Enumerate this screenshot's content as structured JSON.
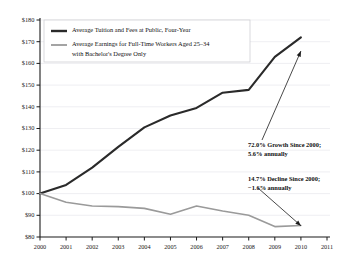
{
  "chart_data": {
    "type": "line",
    "title": "",
    "xlabel": "",
    "ylabel": "",
    "x": [
      2000,
      2001,
      2002,
      2003,
      2004,
      2005,
      2006,
      2007,
      2008,
      2009,
      2010
    ],
    "xlim": [
      2000,
      2011
    ],
    "ylim": [
      80,
      180
    ],
    "y_ticks": [
      "$80",
      "$90",
      "$100",
      "$110",
      "$120",
      "$130",
      "$140",
      "$150",
      "$160",
      "$170",
      "$180"
    ],
    "y_tick_values": [
      80,
      90,
      100,
      110,
      120,
      130,
      140,
      150,
      160,
      170,
      180
    ],
    "x_ticks": [
      "2000",
      "2001",
      "2002",
      "2003",
      "2004",
      "2005",
      "2006",
      "2007",
      "2008",
      "2009",
      "2010",
      "2011"
    ],
    "x_tick_values": [
      2000,
      2001,
      2002,
      2003,
      2004,
      2005,
      2006,
      2007,
      2008,
      2009,
      2010,
      2011
    ],
    "grid": true,
    "legend_position": "top-left",
    "series": [
      {
        "name": "Average Tuition and Fees at Public, Four-Year",
        "color": "#2a2a2a",
        "width": 2.1,
        "values": [
          100.0,
          104.0,
          112.0,
          121.5,
          130.5,
          136.0,
          139.5,
          146.5,
          147.8,
          163.0,
          172.0
        ]
      },
      {
        "name": "Average Earnings for Full-Time Workers Aged 25–34 with Bachelor's Degree Only",
        "color": "#9a9a9a",
        "width": 1.6,
        "values": [
          100.0,
          96.0,
          94.3,
          94.0,
          93.2,
          90.5,
          94.3,
          92.0,
          90.0,
          84.8,
          85.3
        ]
      }
    ],
    "legend": [
      {
        "label": "Average Tuition and Fees at Public, Four-Year",
        "color": "#2a2a2a",
        "line2": ""
      },
      {
        "label": "Average Earnings for Full-Time Workers Aged 25–34",
        "color": "#9a9a9a",
        "line2": "with Bachelor's Degree Only"
      }
    ],
    "annotations": [
      {
        "line1": "72.0% Growth Since 2000;",
        "line2": "5.6% annually",
        "target_x": 2010,
        "target_y": 168.0
      },
      {
        "line1": "14.7% Decline Since 2000;",
        "line2": "−1.6% annually",
        "target_x": 2010,
        "target_y": 87.5
      }
    ]
  }
}
